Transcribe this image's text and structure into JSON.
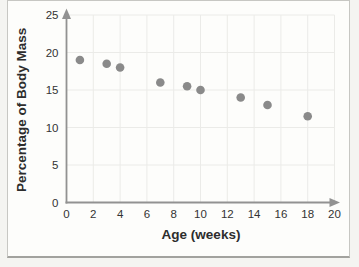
{
  "chart_data": {
    "type": "scatter",
    "title": "",
    "xlabel": "Age (weeks)",
    "ylabel": "Percentage of Body Mass",
    "x": [
      1,
      3,
      4,
      7,
      9,
      10,
      13,
      15,
      18
    ],
    "y": [
      19,
      18.5,
      18,
      16,
      15.5,
      15,
      14,
      13,
      11.5
    ],
    "xlim": [
      0,
      20
    ],
    "ylim": [
      0,
      25
    ],
    "x_ticks": [
      0,
      2,
      4,
      6,
      8,
      10,
      12,
      14,
      16,
      18,
      20
    ],
    "y_ticks": [
      0,
      5,
      10,
      15,
      20,
      25
    ],
    "grid": true,
    "legend": false,
    "axes_arrows": true,
    "marker_color": "#8a8a8a",
    "axis_color": "#929292",
    "grid_color": "#ebebe8",
    "tick_text_color": "#333333",
    "title_text_color": "#2d2d2d"
  }
}
